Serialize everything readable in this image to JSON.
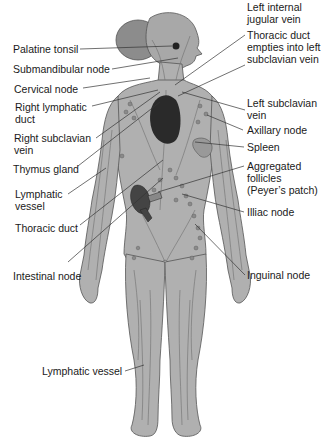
{
  "diagram": {
    "colors": {
      "body": "#a9a9a9",
      "body_outline": "#555555",
      "vessel": "#6e6e6e",
      "node": "#8a8a8a",
      "heart": "#2a2a2a",
      "leader_line": "#333333",
      "text": "#1a1a1a"
    },
    "labels_left": [
      {
        "id": "palatine-tonsil",
        "text": "Palatine tonsil"
      },
      {
        "id": "submandibular-node",
        "text": "Submandibular node"
      },
      {
        "id": "cervical-node",
        "text": "Cervical node"
      },
      {
        "id": "right-lymphatic-duct",
        "text": "Right lymphatic\nduct"
      },
      {
        "id": "right-subclavian-vein",
        "text": "Right subclavian\nvein"
      },
      {
        "id": "thymus-gland",
        "text": "Thymus gland"
      },
      {
        "id": "lymphatic-vessel-arm",
        "text": "Lymphatic\nvessel"
      },
      {
        "id": "thoracic-duct",
        "text": "Thoracic duct"
      },
      {
        "id": "intestinal-node",
        "text": "Intestinal node"
      },
      {
        "id": "lymphatic-vessel-leg",
        "text": "Lymphatic vessel"
      }
    ],
    "labels_right": [
      {
        "id": "left-internal-jugular-vein",
        "text": "Left internal\njugular vein"
      },
      {
        "id": "thoracic-duct-empties",
        "text": "Thoracic duct\nempties into left\nsubclavian vein"
      },
      {
        "id": "left-subclavian-vein",
        "text": "Left subclavian\nvein"
      },
      {
        "id": "axillary-node",
        "text": "Axillary node"
      },
      {
        "id": "spleen",
        "text": "Spleen"
      },
      {
        "id": "aggregated-follicles",
        "text": "Aggregated\nfollicles\n(Peyer’s patch)"
      },
      {
        "id": "illiac-node",
        "text": "Illiac node"
      },
      {
        "id": "inguinal-node",
        "text": "Inguinal node"
      }
    ]
  }
}
